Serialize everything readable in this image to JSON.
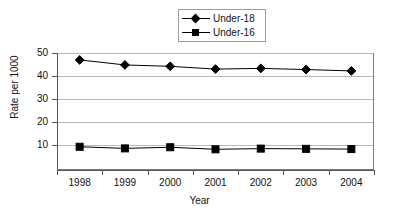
{
  "chart_data": {
    "type": "line",
    "title": "",
    "xlabel": "Year",
    "ylabel": "Rate per 1000",
    "categories": [
      "1998",
      "1999",
      "2000",
      "2001",
      "2002",
      "2003",
      "2004"
    ],
    "series": [
      {
        "name": "Under-18",
        "marker": "diamond",
        "color": "#000000",
        "values": [
          47.0,
          44.8,
          44.2,
          43.0,
          43.3,
          42.8,
          42.2
        ]
      },
      {
        "name": "Under-16",
        "marker": "square",
        "color": "#000000",
        "values": [
          9.2,
          8.5,
          9.0,
          8.1,
          8.4,
          8.3,
          8.2
        ]
      }
    ],
    "ylim": [
      0,
      50
    ],
    "yticks": [
      10,
      20,
      30,
      40,
      50
    ],
    "ytick_labels": [
      "10",
      "20",
      "30",
      "40",
      "50"
    ],
    "grid": "horizontal",
    "legend_position": "top-center",
    "plot_background": "#ffffff",
    "gridline_color": "#b8b8b8",
    "frame_color": "#7d7d7d"
  },
  "legend": {
    "items": [
      {
        "label": "Under-18",
        "marker": "diamond"
      },
      {
        "label": "Under-16",
        "marker": "square"
      }
    ]
  }
}
